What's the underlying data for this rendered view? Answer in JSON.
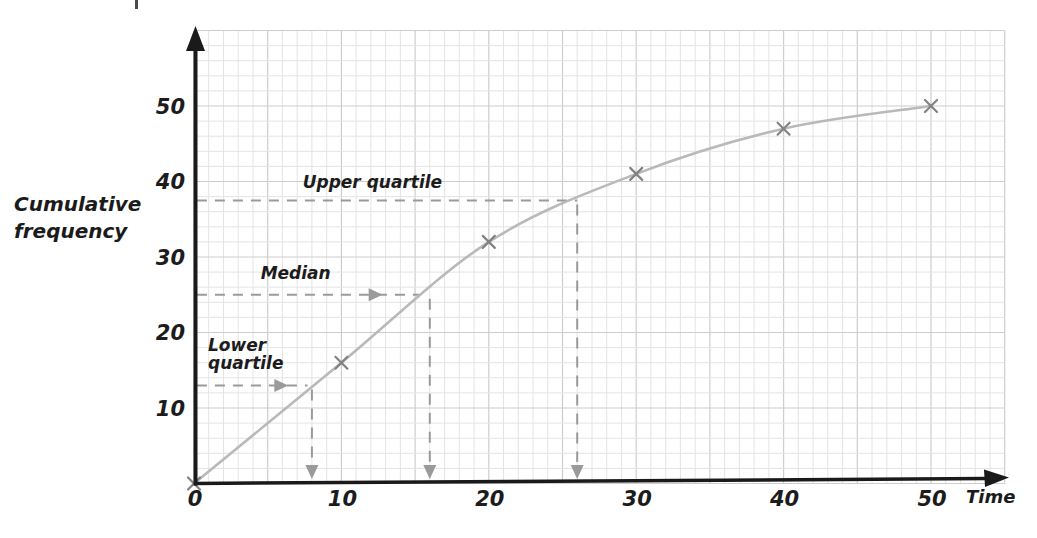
{
  "chart_data": {
    "type": "line",
    "title": "",
    "xlabel": "Time",
    "ylabel": "Cumulative frequency",
    "series_name": "Cumulative frequency curve",
    "marker": "x",
    "x": [
      0,
      10,
      20,
      30,
      40,
      50
    ],
    "values": [
      0,
      16,
      32,
      41,
      47,
      50
    ],
    "xlim": [
      0,
      55
    ],
    "ylim": [
      0,
      60
    ],
    "x_ticks": [
      0,
      10,
      20,
      30,
      40,
      50
    ],
    "y_ticks": [
      10,
      20,
      30,
      40,
      50
    ],
    "grid": {
      "show": true,
      "minor_step_x": 1,
      "minor_step_y": 2,
      "emphasis_every": 5
    },
    "annotations": [
      {
        "label": "Upper quartile",
        "label_lines": [
          "Upper quartile"
        ],
        "y": 37.5,
        "x": 26,
        "h_end": 26,
        "arrow_tip_x": null,
        "anchor": "middle",
        "label_x": 12.1,
        "label_y": 39.2,
        "line_gap": 2.4
      },
      {
        "label": "Median",
        "label_lines": [
          "Median"
        ],
        "y": 25,
        "x": 16,
        "h_end": 15.4,
        "arrow_tip_x": 12.8,
        "anchor": "middle",
        "label_x": 6.9,
        "label_y": 27.1,
        "line_gap": 2.4
      },
      {
        "label": "Lower quartile",
        "label_lines": [
          "Lower",
          "quartile"
        ],
        "y": 13,
        "x": 8,
        "h_end": 7.7,
        "arrow_tip_x": 6.4,
        "anchor": "start",
        "label_x": 0.95,
        "label_y": 17.6,
        "line_gap": 2.4
      }
    ],
    "colors": {
      "axis": "#1a1a1a",
      "curve": "#b9b9b9",
      "marker": "#828282",
      "dashed": "#9a9a9a",
      "grid_minor": "#e4e4e4",
      "grid_major": "#cdcdcd",
      "text": "#1c1c1c",
      "background": "#ffffff"
    }
  }
}
